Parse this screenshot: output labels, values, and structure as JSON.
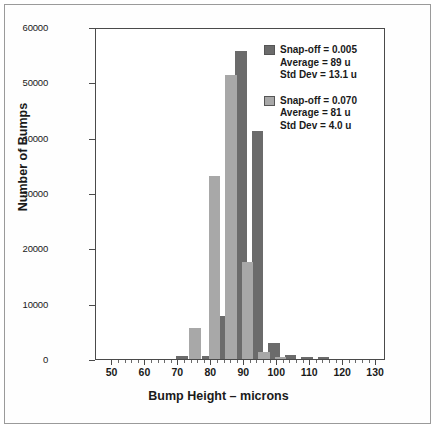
{
  "chart_data": {
    "type": "bar",
    "title": "",
    "xlabel": "Bump Height – microns",
    "ylabel": "Number of Bumps",
    "xlim": [
      45,
      133
    ],
    "ylim": [
      0,
      60000
    ],
    "xticks": [
      50,
      60,
      70,
      80,
      90,
      100,
      110,
      120,
      130
    ],
    "xtick_labels": [
      "50",
      "60",
      "70",
      "80",
      "90",
      "100",
      "110",
      "120",
      "130"
    ],
    "yticks": [
      0,
      10000,
      20000,
      30000,
      40000,
      50000,
      60000
    ],
    "ytick_labels": [
      "0",
      "10000",
      "20000",
      "30000",
      "40000",
      "50000",
      "60000"
    ],
    "grid": false,
    "legend_position": "top-right",
    "bin_width": 4,
    "series": [
      {
        "name": "Snap-off = 0.005",
        "color": "#6b6b6b",
        "average": "89 u",
        "std_dev": "13.1 u",
        "x": [
          71,
          79,
          84,
          89,
          94,
          99,
          104,
          109,
          114
        ],
        "values": [
          500,
          600,
          7800,
          55600,
          41200,
          2900,
          700,
          350,
          350
        ]
      },
      {
        "name": "Snap-off = 0.070",
        "color": "#a8a8a8",
        "average": "81 u",
        "std_dev": "4.0 u",
        "x": [
          75,
          81,
          86,
          91,
          96,
          101
        ],
        "values": [
          5600,
          33100,
          51400,
          17600,
          1350,
          300
        ]
      }
    ]
  },
  "legend": {
    "entries": [
      {
        "swatch_color": "#6b6b6b",
        "line1": "Snap-off = 0.005",
        "line2": "Average = 89 u",
        "line3": "Std Dev = 13.1 u"
      },
      {
        "swatch_color": "#a8a8a8",
        "line1": "Snap-off = 0.070",
        "line2": "Average = 81 u",
        "line3": "Std Dev = 4.0 u"
      }
    ]
  }
}
